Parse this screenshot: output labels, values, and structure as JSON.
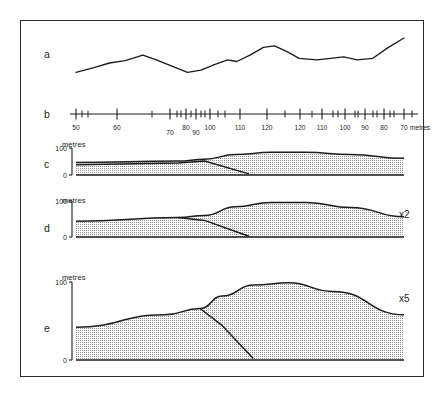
{
  "figure": {
    "background_color": "#ffffff",
    "line_color": "#1d1d1d",
    "fill_color": "#d8d8d8",
    "frame_color": "#2b2b2b"
  },
  "panels": [
    {
      "id": "a",
      "letter": "a",
      "kind": "profile-line",
      "unit_label": "",
      "exaggeration_label": ""
    },
    {
      "id": "b",
      "letter": "b",
      "kind": "scale-bar",
      "unit_label": "",
      "exaggeration_label": ""
    },
    {
      "id": "c",
      "letter": "c",
      "kind": "section",
      "unit_label": "metres",
      "exaggeration_label": "",
      "y_ticks": [
        "100",
        "0"
      ]
    },
    {
      "id": "d",
      "letter": "d",
      "kind": "section",
      "unit_label": "metres",
      "exaggeration_label": "x2",
      "y_ticks": [
        "100",
        "0"
      ]
    },
    {
      "id": "e",
      "letter": "e",
      "kind": "section",
      "unit_label": "metres",
      "exaggeration_label": "x5",
      "y_ticks": [
        "100",
        "0"
      ]
    }
  ],
  "scale_bar": {
    "unit_caption": "metres",
    "labels": [
      "50",
      "60",
      "70",
      "80",
      "90",
      "100",
      "110",
      "120",
      "120",
      "110",
      "100",
      "90",
      "80",
      "70"
    ],
    "major_ticks_x": [
      76,
      117,
      170,
      186,
      196,
      210,
      240,
      267,
      300,
      322,
      345,
      365,
      384,
      404
    ],
    "minor_ticks_x": [
      82,
      88,
      152,
      177,
      181,
      191,
      201,
      205,
      218,
      225,
      285,
      312,
      333,
      338,
      355,
      358,
      373,
      377,
      390,
      394,
      412
    ],
    "axis_y": 114,
    "label_y_default": 130,
    "label_y_offsets": {
      "70": 135,
      "90": 135
    }
  },
  "chart_data": {
    "type": "area",
    "xlabel": "metres",
    "ylabel": "metres",
    "ylim": [
      0,
      100
    ],
    "series": [
      {
        "name": "a-surface-profile",
        "type": "line",
        "points": [
          [
            0,
            40
          ],
          [
            8,
            46
          ],
          [
            15,
            52
          ],
          [
            22,
            55
          ],
          [
            30,
            62
          ],
          [
            36,
            56
          ],
          [
            43,
            48
          ],
          [
            50,
            40
          ],
          [
            56,
            43
          ],
          [
            62,
            50
          ],
          [
            68,
            56
          ],
          [
            72,
            54
          ],
          [
            78,
            62
          ],
          [
            84,
            72
          ],
          [
            89,
            74
          ],
          [
            95,
            66
          ],
          [
            100,
            58
          ],
          [
            108,
            56
          ],
          [
            114,
            58
          ],
          [
            120,
            60
          ],
          [
            126,
            56
          ],
          [
            133,
            58
          ],
          [
            140,
            72
          ],
          [
            147,
            84
          ]
        ]
      },
      {
        "name": "c-upper-surface",
        "type": "line",
        "exaggeration": 1,
        "points": [
          [
            0,
            46
          ],
          [
            46,
            52
          ],
          [
            58,
            58
          ],
          [
            72,
            76
          ],
          [
            88,
            84
          ],
          [
            104,
            84
          ],
          [
            124,
            76
          ],
          [
            148,
            62
          ]
        ]
      },
      {
        "name": "c-lower-boundary",
        "type": "line",
        "exaggeration": 1,
        "points": [
          [
            0,
            38
          ],
          [
            46,
            44
          ],
          [
            58,
            52
          ],
          [
            78,
            4
          ]
        ]
      },
      {
        "name": "c-base",
        "type": "line",
        "exaggeration": 1,
        "points": [
          [
            0,
            0
          ],
          [
            148,
            0
          ]
        ]
      },
      {
        "name": "d-upper-surface",
        "type": "line",
        "exaggeration": 2,
        "points": [
          [
            0,
            44
          ],
          [
            46,
            54
          ],
          [
            58,
            60
          ],
          [
            72,
            84
          ],
          [
            88,
            96
          ],
          [
            104,
            96
          ],
          [
            124,
            82
          ],
          [
            148,
            56
          ]
        ]
      },
      {
        "name": "d-lower-boundary",
        "type": "line",
        "exaggeration": 2,
        "points": [
          [
            46,
            54
          ],
          [
            58,
            46
          ],
          [
            78,
            2
          ]
        ]
      },
      {
        "name": "e-upper-surface",
        "type": "line",
        "exaggeration": 5,
        "points": [
          [
            0,
            42
          ],
          [
            40,
            58
          ],
          [
            56,
            66
          ],
          [
            66,
            82
          ],
          [
            80,
            96
          ],
          [
            96,
            99
          ],
          [
            116,
            88
          ],
          [
            148,
            58
          ]
        ]
      },
      {
        "name": "e-lower-boundary",
        "type": "line",
        "exaggeration": 5,
        "points": [
          [
            56,
            66
          ],
          [
            66,
            44
          ],
          [
            80,
            2
          ]
        ]
      }
    ],
    "legend": {
      "position": "none"
    },
    "grid": false
  }
}
